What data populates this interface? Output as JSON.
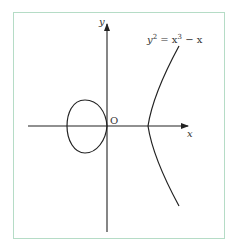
{
  "figure": {
    "equation": {
      "base": "y",
      "exp1": "2",
      "eq": " = x",
      "exp2": "3",
      "tail": " − x"
    },
    "axis_labels": {
      "x": "x",
      "y": "y",
      "origin": "O"
    },
    "colors": {
      "border": "#b5dcc6",
      "curve": "#222222",
      "axis": "#222222"
    }
  }
}
